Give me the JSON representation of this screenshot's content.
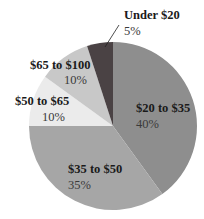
{
  "chart_data": {
    "type": "pie",
    "title": "",
    "categories": [
      "Under $20",
      "$20 to $35",
      "$35 to $50",
      "$50 to $65",
      "$65 to $100"
    ],
    "values": [
      5,
      40,
      35,
      10,
      10
    ],
    "value_labels": [
      "5%",
      "40%",
      "35%",
      "10%",
      "10%"
    ],
    "colors": [
      "#4a4244",
      "#8e8e8e",
      "#a6a6a6",
      "#ebebeb",
      "#c8c8c8"
    ],
    "start_angle": "12 o'clock, clockwise starting with $20 to $35",
    "center": [
      113,
      126
    ],
    "radius": 84,
    "legend": "none (direct labels)"
  },
  "labels": {
    "under20": {
      "cat": "Under $20",
      "pct": "5%"
    },
    "s20to35": {
      "cat": "$20 to $35",
      "pct": "40%"
    },
    "s35to50": {
      "cat": "$35 to $50",
      "pct": "35%"
    },
    "s50to65": {
      "cat": "$50 to $65",
      "pct": "10%"
    },
    "s65to100": {
      "cat": "$65 to $100",
      "pct": "10%"
    }
  }
}
